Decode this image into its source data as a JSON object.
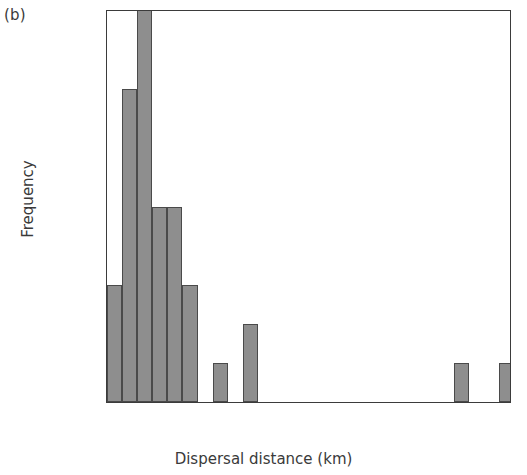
{
  "panel": {
    "label": "(b)"
  },
  "chart_data": {
    "type": "bar",
    "title": "",
    "subtitle": "",
    "xlabel": "Dispersal distance (km)",
    "ylabel": "Frequency",
    "xlim": [
      0,
      26.7
    ],
    "ylim": [
      0,
      10
    ],
    "grid": false,
    "legend": "none",
    "bin_width": 1,
    "note": "Histogram of dispersal distances; the third bar is clipped at the top of the axis (>=10).",
    "xticks": [
      5,
      10,
      15,
      20,
      25
    ],
    "xtick_labels": [
      "5",
      "10",
      "15",
      "20",
      "25"
    ],
    "yticks": [
      0,
      2,
      4,
      6,
      8,
      10
    ],
    "ytick_labels": [
      "0",
      "2",
      "4",
      "6",
      "8",
      "10"
    ],
    "bars": [
      {
        "x0": 0,
        "x1": 1,
        "value": 3,
        "clipped": false
      },
      {
        "x0": 1,
        "x1": 2,
        "value": 8,
        "clipped": false
      },
      {
        "x0": 2,
        "x1": 3,
        "value": 10,
        "clipped": true
      },
      {
        "x0": 3,
        "x1": 4,
        "value": 5,
        "clipped": false
      },
      {
        "x0": 4,
        "x1": 5,
        "value": 5,
        "clipped": false
      },
      {
        "x0": 5,
        "x1": 6,
        "value": 3,
        "clipped": false
      },
      {
        "x0": 6,
        "x1": 7,
        "value": 0,
        "clipped": false
      },
      {
        "x0": 7,
        "x1": 8,
        "value": 1,
        "clipped": false
      },
      {
        "x0": 8,
        "x1": 9,
        "value": 0,
        "clipped": false
      },
      {
        "x0": 9,
        "x1": 10,
        "value": 2,
        "clipped": false
      },
      {
        "x0": 23,
        "x1": 24,
        "value": 1,
        "clipped": false
      },
      {
        "x0": 26,
        "x1": 27,
        "value": 1,
        "clipped": false
      }
    ],
    "colors": {
      "bar_fill": "#8e8e8e",
      "bar_edge": "#4a4a4a",
      "axis": "#3b3b3b",
      "text": "#3a3a3a",
      "background": "#ffffff"
    }
  }
}
